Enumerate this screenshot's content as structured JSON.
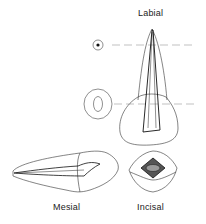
{
  "figure": {
    "views": [
      {
        "id": "labial",
        "label": "Labial"
      },
      {
        "id": "mesial",
        "label": "Mesial"
      },
      {
        "id": "incisal",
        "label": "Incisal"
      }
    ],
    "cross_sections": [
      {
        "id": "apical-section",
        "shape": "small circle with central dot"
      },
      {
        "id": "cervical-section",
        "shape": "oval ring"
      }
    ],
    "reference_lines": 2,
    "colors": {
      "line": "#333333",
      "dash": "#888888",
      "canal": "#222222"
    }
  }
}
